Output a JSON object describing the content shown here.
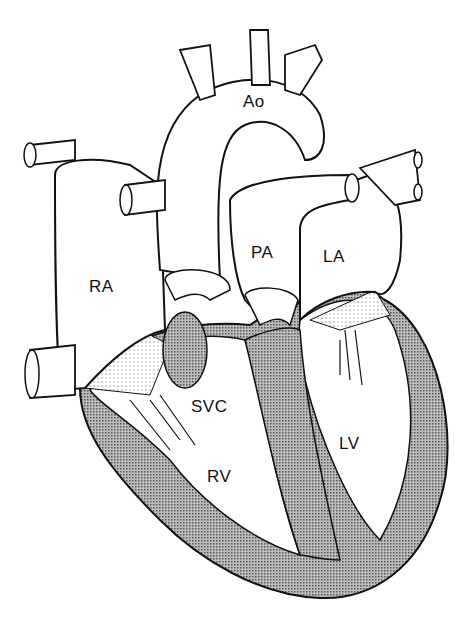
{
  "diagram": {
    "labels": {
      "ao": "Ao",
      "pa": "PA",
      "ra": "RA",
      "la": "LA",
      "svc": "SVC",
      "rv": "RV",
      "lv": "LV"
    },
    "colors": {
      "outline": "#111111",
      "myocardium": "#9a9a9a",
      "background": "#ffffff"
    }
  }
}
